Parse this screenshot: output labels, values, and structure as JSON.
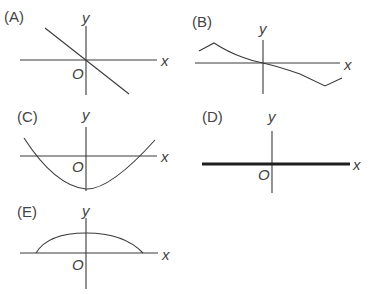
{
  "figure": {
    "axis_labels": {
      "x": "x",
      "y": "y",
      "origin": "O"
    },
    "graphs": [
      {
        "id": "A",
        "label": "(A)",
        "shape": "straight line with negative slope through origin"
      },
      {
        "id": "B",
        "label": "(B)",
        "shape": "decreasing curve through origin with turning points near the ends"
      },
      {
        "id": "C",
        "label": "(C)",
        "shape": "upward-opening parabola with vertex below origin on y-axis"
      },
      {
        "id": "D",
        "label": "(D)",
        "shape": "thick line lying along the x-axis (y = 0)"
      },
      {
        "id": "E",
        "label": "(E)",
        "shape": "downward-opening arc above the x-axis, peak on y-axis"
      }
    ]
  }
}
